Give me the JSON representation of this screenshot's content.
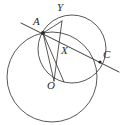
{
  "figure": {
    "background_color": "#ffffff",
    "stroke_color": "#3c3a38",
    "label_color": "#2b2927",
    "width": 125,
    "height": 125
  },
  "labels": {
    "A": "A",
    "Y": "Y",
    "X": "X",
    "C": "C",
    "O": "O"
  },
  "points": {
    "A": {
      "x": 43,
      "y": 33
    },
    "Y": {
      "x": 62,
      "y": 21
    },
    "X": {
      "x": 66,
      "y": 56
    },
    "C": {
      "x": 100,
      "y": 62
    },
    "O": {
      "x": 54,
      "y": 80
    }
  },
  "label_positions": {
    "A": {
      "x": 33,
      "y": 16
    },
    "Y": {
      "x": 57,
      "y": 2
    },
    "X": {
      "x": 60,
      "y": 45
    },
    "C": {
      "x": 103,
      "y": 48
    },
    "O": {
      "x": 47,
      "y": 80
    }
  },
  "circles": [
    {
      "name": "large-circle",
      "cx": 52,
      "cy": 77,
      "r": 45
    },
    {
      "name": "upper-circle",
      "cx": 72,
      "cy": 49,
      "r": 34
    }
  ],
  "segments": [
    {
      "name": "chord-a-y",
      "x1": 43,
      "y1": 33,
      "x2": 62,
      "y2": 21
    },
    {
      "name": "chord-y-o",
      "x1": 62,
      "y1": 21,
      "x2": 54,
      "y2": 81
    },
    {
      "name": "chord-a-o",
      "x1": 43,
      "y1": 33,
      "x2": 54,
      "y2": 81
    },
    {
      "name": "chord-a-lower",
      "x1": 43,
      "y1": 33,
      "x2": 64,
      "y2": 82
    }
  ],
  "secant": {
    "name": "secant-through-a-x-c",
    "x1": 21,
    "y1": 23,
    "x2": 119,
    "y2": 72
  }
}
